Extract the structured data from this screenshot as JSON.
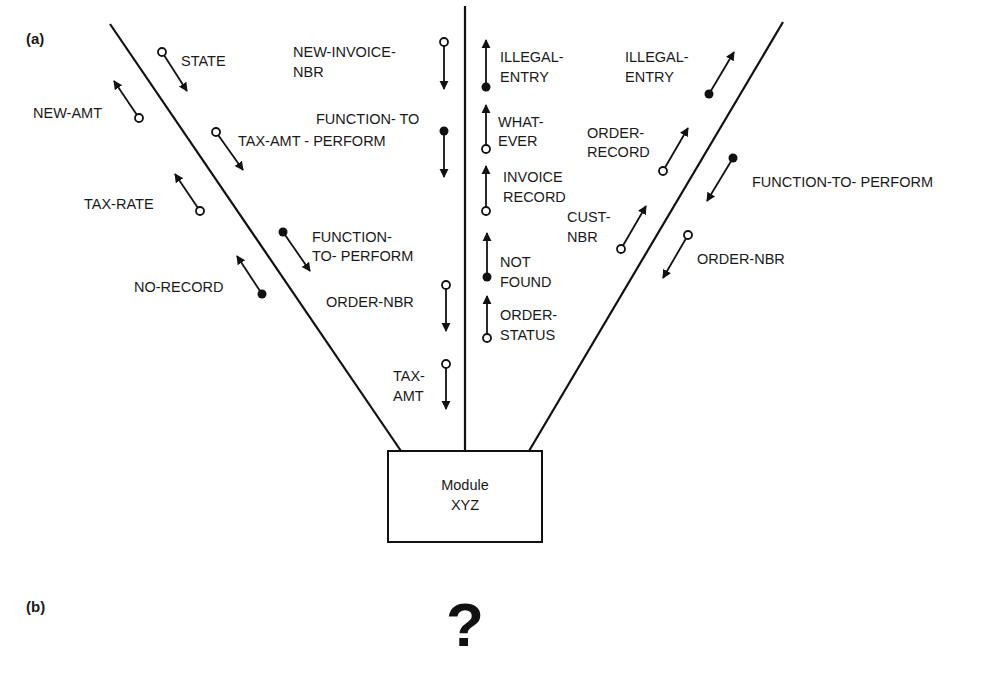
{
  "panels": {
    "a": "(a)",
    "b": "(b)"
  },
  "module": {
    "line1": "Module",
    "line2": "XYZ"
  },
  "question_mark": "?",
  "colors": {
    "ink": "#111111",
    "background": "#ffffff"
  },
  "left_channel": {
    "couples": [
      {
        "label": [
          "STATE"
        ],
        "dot": "open",
        "direction": "in"
      },
      {
        "label": [
          "NEW-AMT"
        ],
        "dot": "open",
        "direction": "out"
      },
      {
        "label": [
          "TAX-AMT - PERFORM"
        ],
        "dot": "open",
        "direction": "in"
      },
      {
        "label": [
          "TAX-RATE"
        ],
        "dot": "open",
        "direction": "out"
      },
      {
        "label": [
          "FUNCTION-",
          "TO- PERFORM"
        ],
        "dot": "filled",
        "direction": "in"
      },
      {
        "label": [
          "NO-RECORD"
        ],
        "dot": "filled",
        "direction": "out"
      }
    ]
  },
  "center_left_channel": {
    "couples": [
      {
        "label": [
          "NEW-INVOICE-",
          "NBR"
        ],
        "dot": "open",
        "direction": "down"
      },
      {
        "label": [
          "FUNCTION- TO"
        ],
        "dot": "filled",
        "direction": "down"
      },
      {
        "label": [
          "ORDER-NBR"
        ],
        "dot": "open",
        "direction": "down"
      },
      {
        "label": [
          "TAX-",
          "AMT"
        ],
        "dot": "open",
        "direction": "down"
      }
    ]
  },
  "center_right_channel": {
    "couples": [
      {
        "label": [
          "ILLEGAL-",
          "ENTRY"
        ],
        "dot": "filled",
        "direction": "up"
      },
      {
        "label": [
          "WHAT-",
          "EVER"
        ],
        "dot": "open",
        "direction": "up"
      },
      {
        "label": [
          "INVOICE",
          "RECORD"
        ],
        "dot": "open",
        "direction": "up"
      },
      {
        "label": [
          "NOT",
          "FOUND"
        ],
        "dot": "filled",
        "direction": "up"
      },
      {
        "label": [
          "ORDER-",
          "STATUS"
        ],
        "dot": "open",
        "direction": "up"
      }
    ]
  },
  "right_channel": {
    "couples": [
      {
        "label": [
          "ILLEGAL-",
          "ENTRY"
        ],
        "dot": "filled",
        "direction": "out"
      },
      {
        "label": [
          "ORDER-",
          "RECORD"
        ],
        "dot": "open",
        "direction": "out"
      },
      {
        "label": [
          "FUNCTION-TO- PERFORM"
        ],
        "dot": "filled",
        "direction": "in"
      },
      {
        "label": [
          "CUST-",
          "NBR"
        ],
        "dot": "open",
        "direction": "out"
      },
      {
        "label": [
          "ORDER-NBR"
        ],
        "dot": "open",
        "direction": "in"
      }
    ]
  }
}
